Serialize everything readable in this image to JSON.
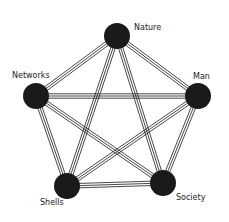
{
  "diagram": {
    "type": "complete-graph",
    "colors": {
      "node": "#1a1a1a",
      "edge": "#1a1a1a",
      "background": "#ffffff",
      "label": "#222222"
    },
    "nodes": [
      {
        "id": "nature",
        "label": "Nature",
        "x": 117,
        "y": 36,
        "r": 13,
        "label_x": 134,
        "label_y": 24
      },
      {
        "id": "networks",
        "label": "Networks",
        "x": 36,
        "y": 96,
        "r": 13,
        "label_x": 12,
        "label_y": 72
      },
      {
        "id": "man",
        "label": "Man",
        "x": 198,
        "y": 96,
        "r": 13,
        "label_x": 193,
        "label_y": 73
      },
      {
        "id": "shells",
        "label": "Shells",
        "x": 67,
        "y": 186,
        "r": 13,
        "label_x": 40,
        "label_y": 199
      },
      {
        "id": "society",
        "label": "Society",
        "x": 163,
        "y": 183,
        "r": 13,
        "label_x": 176,
        "label_y": 194
      }
    ],
    "edges": [
      [
        "nature",
        "networks"
      ],
      [
        "nature",
        "man"
      ],
      [
        "nature",
        "shells"
      ],
      [
        "nature",
        "society"
      ],
      [
        "networks",
        "man"
      ],
      [
        "networks",
        "shells"
      ],
      [
        "networks",
        "society"
      ],
      [
        "man",
        "shells"
      ],
      [
        "man",
        "society"
      ],
      [
        "shells",
        "society"
      ]
    ],
    "edge_style": "triple-line"
  }
}
